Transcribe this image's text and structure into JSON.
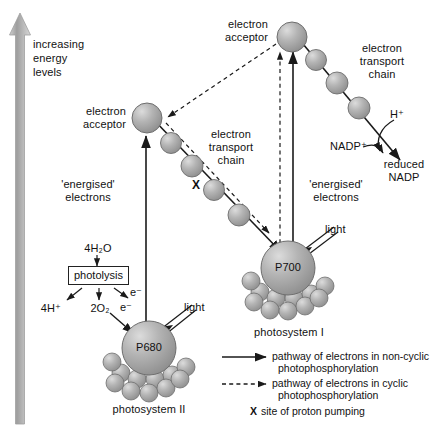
{
  "diagram": {
    "background_color": "#ffffff",
    "sphere_color": "#a8a8a8",
    "line_color": "#1a1a1a"
  },
  "axis": {
    "label_line1": "increasing",
    "label_line2": "energy",
    "label_line3": "levels",
    "arrow_direction": "up",
    "arrow_color": "#9a9a9a"
  },
  "labels": {
    "electron_acceptor_left_line1": "electron",
    "electron_acceptor_left_line2": "acceptor",
    "electron_acceptor_top_line1": "electron",
    "electron_acceptor_top_line2": "acceptor",
    "etc_left_line1": "electron",
    "etc_left_line2": "transport",
    "etc_left_line3": "chain",
    "etc_right_line1": "electron",
    "etc_right_line2": "transport",
    "etc_right_line3": "chain",
    "energised_left_line1": "'energised'",
    "energised_left_line2": "electrons",
    "energised_right_line1": "'energised'",
    "energised_right_line2": "electrons",
    "x_marker_left": "X",
    "light_ps2": "light",
    "light_ps1": "light",
    "photosystem_2": "photosystem II",
    "photosystem_1": "photosystem I",
    "p680": "P680",
    "p700": "P700"
  },
  "photolysis": {
    "input": "4H₂O",
    "box_label": "photolysis",
    "product_protons": "4H⁺",
    "product_oxygen": "2O₂",
    "product_electrons_a": "e⁻",
    "product_electrons_b": "e⁻"
  },
  "nadp": {
    "proton": "H⁺",
    "nadp_plus": "NADP⁺",
    "reduced_line1": "reduced",
    "reduced_line2": "NADP"
  },
  "legend": {
    "items": [
      {
        "style": "solid-arrow",
        "line1": "pathway of electrons in non-cyclic",
        "line2": "photophosphorylation"
      },
      {
        "style": "dashed-arrow",
        "line1": "pathway of electrons in cyclic",
        "line2": "photophosphorylation"
      },
      {
        "style": "x-symbol",
        "symbol": "X",
        "line1": "site of proton pumping",
        "line2": ""
      }
    ]
  }
}
